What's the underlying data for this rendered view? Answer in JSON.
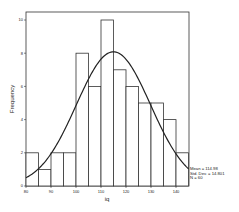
{
  "chart_data": {
    "type": "bar",
    "subtype": "histogram_with_normal_curve",
    "title": "",
    "xlabel": "iq",
    "ylabel": "Frequency",
    "bin_width": 5,
    "bin_edges": [
      80,
      85,
      90,
      95,
      100,
      105,
      110,
      115,
      120,
      125,
      130,
      135,
      140,
      145
    ],
    "categories": [
      "80-85",
      "85-90",
      "90-95",
      "95-100",
      "100-105",
      "105-110",
      "110-115",
      "115-120",
      "120-125",
      "125-130",
      "130-135",
      "135-140",
      "140-145"
    ],
    "values": [
      2,
      1,
      2,
      2,
      8,
      6,
      10,
      7,
      6,
      5,
      5,
      4,
      2
    ],
    "xlim": [
      80,
      145
    ],
    "ylim": [
      0,
      10.5
    ],
    "x_ticks": [
      80,
      90,
      100,
      110,
      120,
      130,
      140
    ],
    "y_ticks": [
      0,
      2,
      4,
      6,
      8,
      10
    ],
    "grid": false,
    "normal_curve": {
      "mean": 114.98,
      "std": 14.801,
      "n": 60
    },
    "annotations": [
      "Mean = 114.98",
      "Std. Dev. = 14.801",
      "N = 60"
    ]
  }
}
